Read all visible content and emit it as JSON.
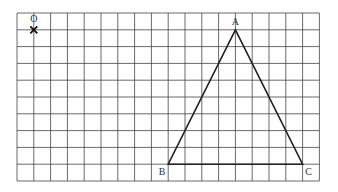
{
  "grid": {
    "cols": 18,
    "rows": 10,
    "origin_x": 17,
    "origin_y": 13,
    "cell": 16.8,
    "line_color": "#444444"
  },
  "marker": {
    "label": "O",
    "symbol": "cross",
    "grid_point": [
      1,
      1
    ]
  },
  "triangle": {
    "line_color": "#222222",
    "vertices": [
      {
        "label": "A",
        "grid_point": [
          13,
          1
        ],
        "label_pos": "above"
      },
      {
        "label": "B",
        "grid_point": [
          9,
          9
        ],
        "label_pos": "below-left"
      },
      {
        "label": "C",
        "grid_point": [
          17,
          9
        ],
        "label_pos": "below-right"
      }
    ]
  }
}
